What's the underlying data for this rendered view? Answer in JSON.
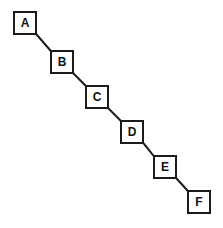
{
  "diagram": {
    "type": "node-link-chain",
    "canvas": {
      "width": 223,
      "height": 228,
      "background": "#ffffff"
    },
    "style": {
      "node_fill": "#ffffff",
      "node_stroke": "#1a1a1a",
      "node_stroke_width": 2,
      "edge_stroke": "#1a1a1a",
      "edge_stroke_width": 2,
      "label_color": "#111111",
      "label_font_size": 12
    },
    "nodes": [
      {
        "id": "A",
        "label": "A",
        "x": 13,
        "y": 11,
        "w": 24,
        "h": 24
      },
      {
        "id": "B",
        "label": "B",
        "x": 50,
        "y": 50,
        "w": 24,
        "h": 24
      },
      {
        "id": "C",
        "label": "C",
        "x": 85,
        "y": 85,
        "w": 24,
        "h": 24
      },
      {
        "id": "D",
        "label": "D",
        "x": 120,
        "y": 120,
        "w": 24,
        "h": 24
      },
      {
        "id": "E",
        "label": "E",
        "x": 153,
        "y": 155,
        "w": 24,
        "h": 24
      },
      {
        "id": "F",
        "label": "F",
        "x": 187,
        "y": 190,
        "w": 24,
        "h": 24
      }
    ],
    "edges": [
      {
        "from": "A",
        "to": "B",
        "x1": 37,
        "y1": 35,
        "x2": 50,
        "y2": 50
      },
      {
        "from": "B",
        "to": "C",
        "x1": 74,
        "y1": 74,
        "x2": 85,
        "y2": 85
      },
      {
        "from": "C",
        "to": "D",
        "x1": 109,
        "y1": 109,
        "x2": 120,
        "y2": 120
      },
      {
        "from": "D",
        "to": "E",
        "x1": 144,
        "y1": 144,
        "x2": 153,
        "y2": 155
      },
      {
        "from": "E",
        "to": "F",
        "x1": 177,
        "y1": 179,
        "x2": 187,
        "y2": 190
      }
    ]
  }
}
